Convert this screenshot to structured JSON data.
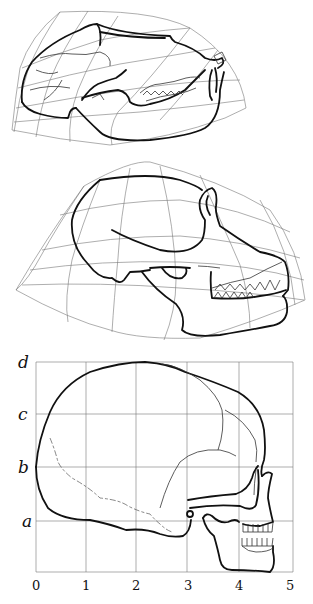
{
  "figure": {
    "panels": [
      {
        "id": "top",
        "subject": "baboon-skull",
        "grid": "transformed-curvilinear"
      },
      {
        "id": "middle",
        "subject": "chimpanzee-skull",
        "grid": "transformed-curvilinear"
      },
      {
        "id": "bottom",
        "subject": "human-skull",
        "grid": "cartesian"
      }
    ],
    "bottom_grid": {
      "y_labels": [
        "d",
        "c",
        "b",
        "a"
      ],
      "x_labels": [
        "0",
        "1",
        "2",
        "3",
        "4",
        "5"
      ]
    }
  }
}
